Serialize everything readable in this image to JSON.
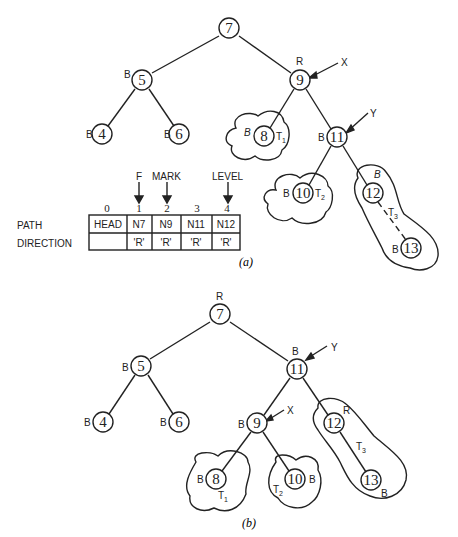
{
  "figure_a": {
    "caption": "(a)",
    "nodes": [
      {
        "key": "7",
        "color": "",
        "x": 229,
        "y": 28
      },
      {
        "key": "5",
        "color": "B",
        "x": 142,
        "y": 80
      },
      {
        "key": "9",
        "color": "R",
        "x": 300,
        "y": 80
      },
      {
        "key": "4",
        "color": "B",
        "x": 102,
        "y": 134
      },
      {
        "key": "6",
        "color": "B",
        "x": 179,
        "y": 134
      },
      {
        "key": "8",
        "color": "B",
        "x": 264,
        "y": 136
      },
      {
        "key": "11",
        "color": "B",
        "x": 337,
        "y": 137
      },
      {
        "key": "10",
        "color": "B",
        "x": 303,
        "y": 193
      },
      {
        "key": "12",
        "color": "B",
        "x": 373,
        "y": 193
      },
      {
        "key": "13",
        "color": "B",
        "x": 411,
        "y": 248
      }
    ],
    "subtrees": [
      "T1",
      "T2",
      "T3"
    ],
    "pointers": {
      "x": "X",
      "y": "Y"
    },
    "table": {
      "pointer_labels": [
        "F",
        "MARK",
        "LEVEL"
      ],
      "indices": [
        "0",
        "1",
        "2",
        "3",
        "4"
      ],
      "rows": [
        {
          "label": "PATH",
          "cells": [
            "HEAD",
            "N7",
            "N9",
            "N11",
            "N12"
          ]
        },
        {
          "label": "DIRECTION",
          "cells": [
            "",
            "'R'",
            "'R'",
            "'R'",
            "'R'"
          ]
        }
      ]
    }
  },
  "figure_b": {
    "caption": "(b)",
    "nodes": [
      {
        "key": "7",
        "color": "R",
        "x": 220,
        "y": 314
      },
      {
        "key": "5",
        "color": "B",
        "x": 141,
        "y": 366
      },
      {
        "key": "11",
        "color": "B",
        "x": 297,
        "y": 369
      },
      {
        "key": "4",
        "color": "B",
        "x": 103,
        "y": 422
      },
      {
        "key": "6",
        "color": "B",
        "x": 179,
        "y": 422
      },
      {
        "key": "9",
        "color": "B",
        "x": 257,
        "y": 423
      },
      {
        "key": "12",
        "color": "R",
        "x": 334,
        "y": 423
      },
      {
        "key": "8",
        "color": "B",
        "x": 216,
        "y": 479
      },
      {
        "key": "10",
        "color": "B",
        "x": 295,
        "y": 479
      },
      {
        "key": "13",
        "color": "B",
        "x": 371,
        "y": 480
      }
    ],
    "subtrees": [
      "T1",
      "T2",
      "T3"
    ],
    "pointers": {
      "x": "X",
      "y": "Y"
    }
  }
}
